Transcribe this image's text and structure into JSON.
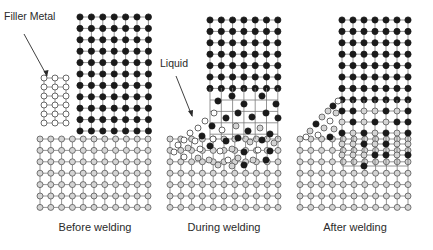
{
  "figure": {
    "labels": {
      "filler_metal": "Filler Metal",
      "liquid": "Liquid"
    },
    "captions": {
      "before": "Before welding",
      "during": "During welding",
      "after": "After welding"
    },
    "colors": {
      "line": "#7a7a7a",
      "black_atom": "#1a1a1a",
      "gray_atom_fill": "#d4d4d4",
      "gray_atom_stroke": "#555555",
      "white_atom_fill": "#ffffff",
      "white_atom_stroke": "#444444",
      "text": "#2a2a2a"
    },
    "panels": [
      {
        "id": "before",
        "base_grid": {
          "x0": 40,
          "y0": 139,
          "cols": 11,
          "rows": 7,
          "dx": 10.8,
          "dy": 11.4,
          "atom": "gray"
        },
        "top_grid": {
          "x0": 80,
          "y0": 17,
          "cols": 7,
          "rows": 11,
          "dx": 11.4,
          "dy": 11.4,
          "atom": "black"
        },
        "filler_grid": {
          "x0": 44,
          "y0": 78,
          "cols": 3,
          "rows": 6,
          "dx": 11,
          "dy": 9,
          "atom": "white"
        }
      },
      {
        "id": "during",
        "base_grid": {
          "x0": 170,
          "y0": 139,
          "cols": 11,
          "rows": 7,
          "dx": 10.8,
          "dy": 11.4,
          "atom": "gray"
        },
        "top_grid": {
          "x0": 210,
          "y0": 20,
          "cols": 7,
          "rows": 7,
          "dx": 11.3,
          "dy": 11.4,
          "atom": "black"
        }
      },
      {
        "id": "after",
        "base_grid": {
          "x0": 300,
          "y0": 139,
          "cols": 11,
          "rows": 7,
          "dx": 10.8,
          "dy": 11.4,
          "atom": "gray"
        },
        "top_grid": {
          "x0": 342,
          "y0": 20,
          "cols": 7,
          "rows": 8,
          "dx": 11,
          "dy": 11.4,
          "atom": "black"
        }
      }
    ],
    "during_liquid_atoms": [
      {
        "x": 218,
        "y": 101,
        "t": "black"
      },
      {
        "x": 232,
        "y": 96,
        "t": "black"
      },
      {
        "x": 244,
        "y": 104,
        "t": "black"
      },
      {
        "x": 262,
        "y": 96,
        "t": "black"
      },
      {
        "x": 276,
        "y": 104,
        "t": "black"
      },
      {
        "x": 214,
        "y": 113,
        "t": "white"
      },
      {
        "x": 226,
        "y": 118,
        "t": "black"
      },
      {
        "x": 238,
        "y": 113,
        "t": "black"
      },
      {
        "x": 252,
        "y": 117,
        "t": "black"
      },
      {
        "x": 266,
        "y": 113,
        "t": "black"
      },
      {
        "x": 278,
        "y": 118,
        "t": "black"
      },
      {
        "x": 205,
        "y": 121,
        "t": "white"
      },
      {
        "x": 212,
        "y": 126,
        "t": "black"
      },
      {
        "x": 222,
        "y": 130,
        "t": "white"
      },
      {
        "x": 236,
        "y": 126,
        "t": "gray"
      },
      {
        "x": 248,
        "y": 131,
        "t": "black"
      },
      {
        "x": 260,
        "y": 128,
        "t": "gray"
      },
      {
        "x": 270,
        "y": 134,
        "t": "black"
      },
      {
        "x": 198,
        "y": 128,
        "t": "white"
      },
      {
        "x": 190,
        "y": 133,
        "t": "white"
      },
      {
        "x": 202,
        "y": 136,
        "t": "black"
      },
      {
        "x": 213,
        "y": 139,
        "t": "white"
      },
      {
        "x": 226,
        "y": 141,
        "t": "black"
      },
      {
        "x": 238,
        "y": 138,
        "t": "black"
      },
      {
        "x": 250,
        "y": 142,
        "t": "gray"
      },
      {
        "x": 262,
        "y": 140,
        "t": "black"
      },
      {
        "x": 274,
        "y": 143,
        "t": "gray"
      },
      {
        "x": 184,
        "y": 140,
        "t": "white"
      },
      {
        "x": 195,
        "y": 141,
        "t": "white"
      },
      {
        "x": 178,
        "y": 145,
        "t": "white"
      },
      {
        "x": 188,
        "y": 148,
        "t": "gray"
      },
      {
        "x": 200,
        "y": 149,
        "t": "white"
      },
      {
        "x": 210,
        "y": 146,
        "t": "black"
      },
      {
        "x": 220,
        "y": 151,
        "t": "white"
      },
      {
        "x": 232,
        "y": 149,
        "t": "gray"
      },
      {
        "x": 244,
        "y": 152,
        "t": "black"
      },
      {
        "x": 258,
        "y": 150,
        "t": "white"
      },
      {
        "x": 270,
        "y": 151,
        "t": "black"
      },
      {
        "x": 174,
        "y": 152,
        "t": "white"
      },
      {
        "x": 184,
        "y": 157,
        "t": "white"
      },
      {
        "x": 198,
        "y": 158,
        "t": "gray"
      },
      {
        "x": 209,
        "y": 160,
        "t": "gray"
      },
      {
        "x": 228,
        "y": 160,
        "t": "white"
      },
      {
        "x": 238,
        "y": 158,
        "t": "gray"
      },
      {
        "x": 253,
        "y": 160,
        "t": "gray"
      },
      {
        "x": 266,
        "y": 160,
        "t": "black"
      },
      {
        "x": 218,
        "y": 165,
        "t": "gray"
      },
      {
        "x": 232,
        "y": 166,
        "t": "gray"
      },
      {
        "x": 244,
        "y": 165,
        "t": "black"
      }
    ],
    "after_fused_atoms": [
      {
        "x": 342,
        "y": 111,
        "t": "black"
      },
      {
        "x": 353,
        "y": 111,
        "t": "black"
      },
      {
        "x": 364,
        "y": 111,
        "t": "gray"
      },
      {
        "x": 375,
        "y": 111,
        "t": "gray"
      },
      {
        "x": 386,
        "y": 111,
        "t": "black"
      },
      {
        "x": 397,
        "y": 111,
        "t": "gray"
      },
      {
        "x": 408,
        "y": 111,
        "t": "black"
      },
      {
        "x": 342,
        "y": 122,
        "t": "gray"
      },
      {
        "x": 353,
        "y": 122,
        "t": "black"
      },
      {
        "x": 364,
        "y": 122,
        "t": "gray"
      },
      {
        "x": 375,
        "y": 122,
        "t": "black"
      },
      {
        "x": 386,
        "y": 122,
        "t": "gray"
      },
      {
        "x": 397,
        "y": 122,
        "t": "black"
      },
      {
        "x": 408,
        "y": 122,
        "t": "black"
      },
      {
        "x": 342,
        "y": 133,
        "t": "black"
      },
      {
        "x": 353,
        "y": 133,
        "t": "gray"
      },
      {
        "x": 364,
        "y": 133,
        "t": "black"
      },
      {
        "x": 375,
        "y": 133,
        "t": "gray"
      },
      {
        "x": 386,
        "y": 133,
        "t": "black"
      },
      {
        "x": 397,
        "y": 133,
        "t": "gray"
      },
      {
        "x": 408,
        "y": 133,
        "t": "black"
      },
      {
        "x": 338,
        "y": 101,
        "t": "white"
      },
      {
        "x": 333,
        "y": 106,
        "t": "black"
      },
      {
        "x": 328,
        "y": 111,
        "t": "gray"
      },
      {
        "x": 336,
        "y": 113,
        "t": "gray"
      },
      {
        "x": 322,
        "y": 117,
        "t": "gray"
      },
      {
        "x": 330,
        "y": 121,
        "t": "white"
      },
      {
        "x": 316,
        "y": 124,
        "t": "black"
      },
      {
        "x": 324,
        "y": 128,
        "t": "gray"
      },
      {
        "x": 334,
        "y": 129,
        "t": "gray"
      },
      {
        "x": 310,
        "y": 131,
        "t": "gray"
      },
      {
        "x": 318,
        "y": 135,
        "t": "white"
      },
      {
        "x": 306,
        "y": 137,
        "t": "white"
      },
      {
        "x": 330,
        "y": 137,
        "t": "black"
      },
      {
        "x": 342,
        "y": 144,
        "t": "gray"
      },
      {
        "x": 353,
        "y": 144,
        "t": "gray"
      },
      {
        "x": 364,
        "y": 144,
        "t": "black"
      },
      {
        "x": 375,
        "y": 144,
        "t": "gray"
      },
      {
        "x": 386,
        "y": 144,
        "t": "black"
      },
      {
        "x": 397,
        "y": 144,
        "t": "gray"
      },
      {
        "x": 408,
        "y": 144,
        "t": "gray"
      },
      {
        "x": 342,
        "y": 155,
        "t": "gray"
      },
      {
        "x": 353,
        "y": 155,
        "t": "gray"
      },
      {
        "x": 364,
        "y": 155,
        "t": "gray"
      },
      {
        "x": 375,
        "y": 155,
        "t": "black"
      },
      {
        "x": 386,
        "y": 155,
        "t": "black"
      },
      {
        "x": 397,
        "y": 155,
        "t": "gray"
      },
      {
        "x": 408,
        "y": 155,
        "t": "black"
      },
      {
        "x": 364,
        "y": 166,
        "t": "black"
      }
    ]
  }
}
